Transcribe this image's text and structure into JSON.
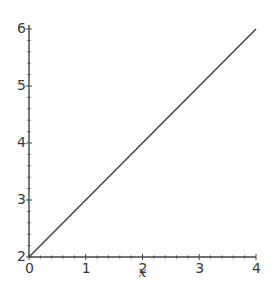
{
  "chart_data": {
    "type": "line",
    "title": "",
    "xlabel": "x",
    "ylabel": "",
    "xlim": [
      0,
      4
    ],
    "ylim": [
      2,
      6
    ],
    "grid": false,
    "legend": null,
    "x_ticks": [
      "0",
      "1",
      "2",
      "3",
      "4"
    ],
    "y_ticks": [
      "2",
      "3",
      "4",
      "5",
      "6"
    ],
    "x_minor_ticks_per_major": 4,
    "y_minor_ticks_per_major": 4,
    "series": [
      {
        "name": "y = x + 2",
        "color": "#444444",
        "x": [
          0,
          4
        ],
        "y": [
          2,
          6
        ]
      }
    ]
  },
  "axes": {
    "color": "#444444",
    "label_color": "#3a3a3a"
  }
}
